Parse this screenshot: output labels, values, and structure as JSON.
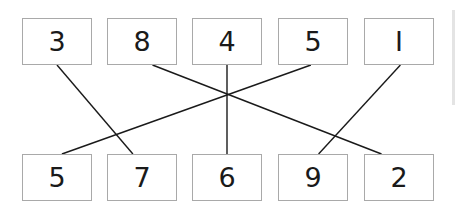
{
  "diagram": {
    "top_row": [
      {
        "id": "t0",
        "label": "3"
      },
      {
        "id": "t1",
        "label": "8"
      },
      {
        "id": "t2",
        "label": "4"
      },
      {
        "id": "t3",
        "label": "5"
      },
      {
        "id": "t4",
        "label": "I"
      }
    ],
    "bottom_row": [
      {
        "id": "b0",
        "label": "5"
      },
      {
        "id": "b1",
        "label": "7"
      },
      {
        "id": "b2",
        "label": "6"
      },
      {
        "id": "b3",
        "label": "9"
      },
      {
        "id": "b4",
        "label": "2"
      }
    ],
    "connections": [
      {
        "from": "t0",
        "to": "b1",
        "from_label": "3",
        "to_label": "7"
      },
      {
        "from": "t1",
        "to": "b4",
        "from_label": "8",
        "to_label": "2"
      },
      {
        "from": "t2",
        "to": "b2",
        "from_label": "4",
        "to_label": "6"
      },
      {
        "from": "t3",
        "to": "b0",
        "from_label": "5",
        "to_label": "5"
      },
      {
        "from": "t4",
        "to": "b3",
        "from_label": "1",
        "to_label": "9"
      }
    ],
    "colors": {
      "line": "#1a1a1a",
      "box_border": "#a9a9a9",
      "text": "#1a1a1a"
    }
  }
}
